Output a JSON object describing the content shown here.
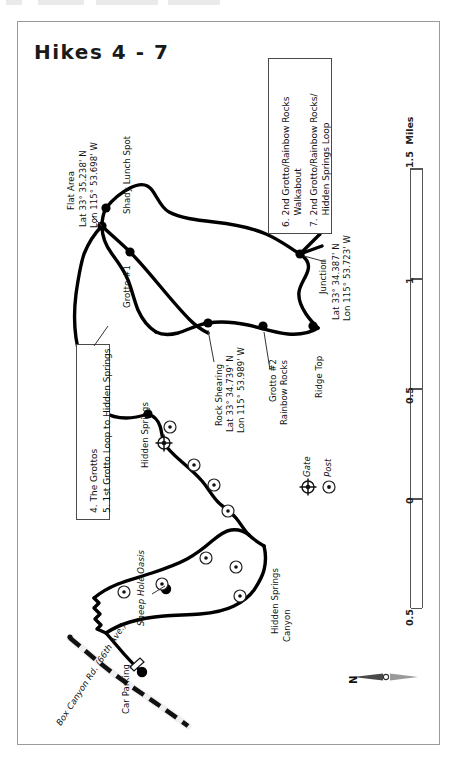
{
  "page": {
    "title": "Hikes 4 - 7",
    "background": "#ffffff",
    "frame_color": "#9a9a9a"
  },
  "map": {
    "orientation_note": "map body rotated 90 degrees; labels read bottom-to-top",
    "north_arrow_label": "N",
    "trail_color": "#000000",
    "road_color": "#000000"
  },
  "legend_boxes": [
    {
      "name": "legend-box-grottos",
      "lines": [
        "4. The Grottos",
        "5. 1st Grotto Loop to Hidden Springs"
      ]
    },
    {
      "name": "legend-box-rainbow-rocks",
      "lines": [
        "6. 2nd Grotto/Rainbow Rocks",
        "    Walkabout",
        "7. 2nd Grotto/Rainbow Rocks/",
        "    Hidden Springs Loop"
      ]
    }
  ],
  "symbol_legend": [
    {
      "name": "gate",
      "label": "Gate",
      "symbol": "gate-icon"
    },
    {
      "name": "post",
      "label": "Post",
      "symbol": "post-icon"
    }
  ],
  "waypoints": [
    {
      "name": "flat-area",
      "label": "Flat Area",
      "lat": "Lat 33° 35.238' N",
      "lon": "Lon 115° 53.698' W"
    },
    {
      "name": "shady-lunch-spot",
      "label": "Shady Lunch Spot"
    },
    {
      "name": "grotto-1",
      "label": "Grotto #1"
    },
    {
      "name": "rock-shearing",
      "label": "Rock Shearing",
      "lat": "Lat 33° 34.739' N",
      "lon": "Lon 115° 53.989' W"
    },
    {
      "name": "grotto-2",
      "label": "Grotto #2",
      "label2": "Rainbow Rocks"
    },
    {
      "name": "ridge-top",
      "label": "Ridge Top"
    },
    {
      "name": "junction",
      "label": "Junction",
      "lat": "Lat 33° 34.387' N",
      "lon": "Lon 115° 53.723' W"
    },
    {
      "name": "hidden-springs",
      "label": "Hidden Springs"
    },
    {
      "name": "sheep-hole-oasis",
      "label": "Sheep Hole Oasis"
    },
    {
      "name": "hidden-springs-canyon",
      "label": "Hidden Springs",
      "label2": "Canyon"
    },
    {
      "name": "car-parking",
      "label": "Car Parking"
    },
    {
      "name": "box-canyon-road",
      "label": "Box Canyon Rd. (66th Ave.)"
    }
  ],
  "scale_bar": {
    "units_label": "1.5  Miles",
    "ticks": [
      "0.5",
      "0",
      "0.5",
      "1",
      "1.5  Miles"
    ]
  }
}
